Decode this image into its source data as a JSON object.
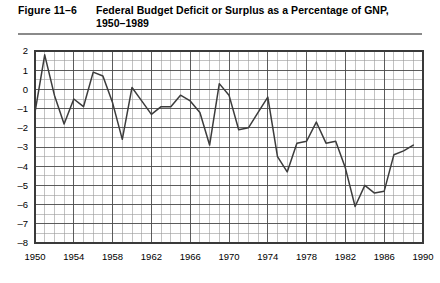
{
  "figure": {
    "number": "Figure 11–6",
    "title_line1": "Federal Budget Deficit or Surplus as a Percentage of GNP,",
    "title_line2": "1950–1989"
  },
  "chart_data": {
    "type": "line",
    "title": "Federal Budget Deficit or Surplus as a Percentage of GNP, 1950–1989",
    "xlabel": "",
    "ylabel": "",
    "xlim": [
      1950,
      1990
    ],
    "ylim": [
      -8,
      2
    ],
    "grid": true,
    "grid_x_step": 1,
    "grid_y_step": 0.5,
    "legend": "none",
    "x_tick_labels": [
      "1950",
      "1954",
      "1958",
      "1962",
      "1966",
      "1970",
      "1974",
      "1978",
      "1982",
      "1986",
      "1990"
    ],
    "x_tick_values": [
      1950,
      1954,
      1958,
      1962,
      1966,
      1970,
      1974,
      1978,
      1982,
      1986,
      1990
    ],
    "y_tick_labels": [
      "2",
      "1",
      "0",
      "–1",
      "–2",
      "–3",
      "–4",
      "–5",
      "–6",
      "–7",
      "–8"
    ],
    "y_tick_values": [
      2,
      1,
      0,
      -1,
      -2,
      -3,
      -4,
      -5,
      -6,
      -7,
      -8
    ],
    "line_color": "#3c3c3c",
    "grid_color": "#9a9a9a",
    "axis_color": "#4a4a4a",
    "x": [
      1950,
      1951,
      1952,
      1953,
      1954,
      1955,
      1956,
      1957,
      1958,
      1959,
      1960,
      1961,
      1962,
      1963,
      1964,
      1965,
      1966,
      1967,
      1968,
      1969,
      1970,
      1971,
      1972,
      1973,
      1974,
      1975,
      1976,
      1977,
      1978,
      1979,
      1980,
      1981,
      1982,
      1983,
      1984,
      1985,
      1986,
      1987,
      1988,
      1989
    ],
    "y": [
      -1.2,
      1.8,
      -0.3,
      -1.8,
      -0.5,
      -0.9,
      0.9,
      0.7,
      -0.7,
      -2.6,
      0.1,
      -0.6,
      -1.3,
      -0.9,
      -0.9,
      -0.3,
      -0.6,
      -1.2,
      -2.9,
      0.3,
      -0.3,
      -2.1,
      -2.0,
      -1.2,
      -0.4,
      -3.5,
      -4.3,
      -2.8,
      -2.7,
      -1.7,
      -2.8,
      -2.7,
      -4.1,
      -6.1,
      -5.0,
      -5.4,
      -5.3,
      -3.4,
      -3.2,
      -2.9
    ],
    "series": [
      {
        "name": "Federal budget surplus/deficit as % of GNP",
        "values": [
          -1.2,
          1.8,
          -0.3,
          -1.8,
          -0.5,
          -0.9,
          0.9,
          0.7,
          -0.7,
          -2.6,
          0.1,
          -0.6,
          -1.3,
          -0.9,
          -0.9,
          -0.3,
          -0.6,
          -1.2,
          -2.9,
          0.3,
          -0.3,
          -2.1,
          -2.0,
          -1.2,
          -0.4,
          -3.5,
          -4.3,
          -2.8,
          -2.7,
          -1.7,
          -2.8,
          -2.7,
          -4.1,
          -6.1,
          -5.0,
          -5.4,
          -5.3,
          -3.4,
          -3.2,
          -2.9
        ]
      }
    ]
  }
}
